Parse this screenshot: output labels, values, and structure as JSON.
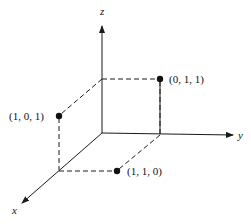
{
  "axes": {
    "x_label": "x",
    "y_label": "y",
    "z_label": "z"
  },
  "points": [
    {
      "label": "(0, 1, 1)",
      "coords": [
        0,
        1,
        1
      ]
    },
    {
      "label": "(1, 0, 1)",
      "coords": [
        1,
        0,
        1
      ]
    },
    {
      "label": "(1, 1, 0)",
      "coords": [
        1,
        1,
        0
      ]
    }
  ],
  "colors": {
    "ink": "#1a1a1a",
    "background": "#ffffff"
  }
}
